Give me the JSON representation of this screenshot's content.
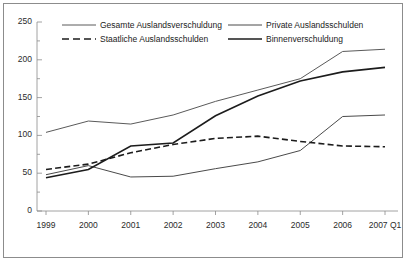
{
  "chart_data": {
    "type": "line",
    "title": "",
    "subtitle": "",
    "xlabel": "",
    "ylabel": "",
    "categories": [
      "1999",
      "2000",
      "2001",
      "2002",
      "2003",
      "2004",
      "2005",
      "2006",
      "2007 Q1"
    ],
    "x_tick_labels": [
      "1999",
      "2000",
      "2001",
      "2002",
      "2003",
      "2004",
      "2005",
      "2006",
      "2007 Q1"
    ],
    "y_tick_labels": [
      "0",
      "50",
      "100",
      "150",
      "200",
      "250"
    ],
    "y_ticks": [
      0,
      50,
      100,
      150,
      200,
      250
    ],
    "ylim": [
      0,
      250
    ],
    "minor_ticks": true,
    "grid": false,
    "legend_position": "top-inside",
    "series": [
      {
        "name": "Gesamte Auslandsverschuldung",
        "style": "solid",
        "color": "#5a5a5a",
        "width": 1,
        "values": [
          104,
          119,
          115,
          127,
          145,
          160,
          175,
          211,
          214
        ]
      },
      {
        "name": "Private Auslandsschulden",
        "style": "solid",
        "color": "#4a4a4a",
        "width": 1,
        "values": [
          48,
          60,
          45,
          46,
          56,
          65,
          80,
          125,
          127
        ]
      },
      {
        "name": "Staatliche Auslandsschulden",
        "style": "dashed",
        "color": "#1c1c1c",
        "width": 1.6,
        "values": [
          55,
          62,
          77,
          88,
          96,
          99,
          92,
          86,
          85
        ]
      },
      {
        "name": "Binnenverschuldung",
        "style": "solid",
        "color": "#1c1c1c",
        "width": 1.6,
        "values": [
          44,
          55,
          86,
          90,
          126,
          152,
          172,
          184,
          190
        ]
      }
    ]
  },
  "legend": {
    "entries": [
      {
        "label": "Gesamte Auslandsverschuldung",
        "style": "solid",
        "color": "#5a5a5a",
        "width": 1
      },
      {
        "label": "Private Auslandsschulden",
        "style": "solid",
        "color": "#4a4a4a",
        "width": 1
      },
      {
        "label": "Staatliche Auslandsschulden",
        "style": "dashed",
        "color": "#1c1c1c",
        "width": 1.6
      },
      {
        "label": "Binnenverschuldung",
        "style": "solid",
        "color": "#1c1c1c",
        "width": 1.6
      }
    ]
  },
  "axes": {
    "axis_color": "#8c8c8c",
    "tick_color": "#8c8c8c",
    "label_color": "#2b2b2b"
  },
  "frame": {
    "border_color": "#8c8c8c",
    "background": "#ffffff"
  }
}
